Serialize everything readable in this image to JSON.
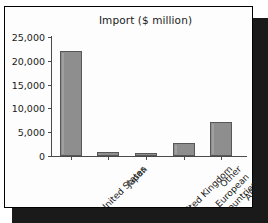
{
  "chart_data": {
    "type": "bar",
    "title": "Import ($ million)",
    "xlabel": "",
    "ylabel": "",
    "categories": [
      "United States",
      "Japan",
      "United Kingdom",
      "Other European Countries",
      "All Others"
    ],
    "values": [
      22000,
      900,
      700,
      2700,
      7100
    ],
    "ylim": [
      0,
      25000
    ],
    "yticks": [
      0,
      5000,
      10000,
      15000,
      20000,
      25000
    ],
    "ytick_labels": [
      "0",
      "5,000",
      "10,000",
      "15,000",
      "20,000",
      "25,000"
    ],
    "grid": false,
    "legend": null,
    "bar_color": "#8e8e8e",
    "bar_edge_color": "#575757",
    "plot_background": "#fdfdfd",
    "frame_color": "#000000",
    "axis_color": "#4a4a4a",
    "label_rotation": -45
  }
}
